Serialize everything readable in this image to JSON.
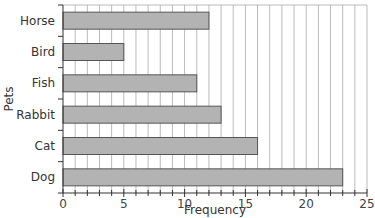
{
  "chart_data": {
    "type": "bar",
    "orientation": "horizontal",
    "title": "",
    "xlabel": "Frequency",
    "ylabel": "Pets",
    "categories": [
      "Horse",
      "Bird",
      "Fish",
      "Rabbit",
      "Cat",
      "Dog"
    ],
    "values": [
      12,
      5,
      11,
      13,
      16,
      23
    ],
    "xlim": [
      0,
      25
    ],
    "xticks": [
      0,
      5,
      10,
      15,
      20,
      25
    ],
    "minor_xtick_step": 1,
    "grid": "vertical lines every 1 unit",
    "legend": null,
    "bar_color": "#b3b3b3",
    "bar_edge_color": "#555555"
  }
}
